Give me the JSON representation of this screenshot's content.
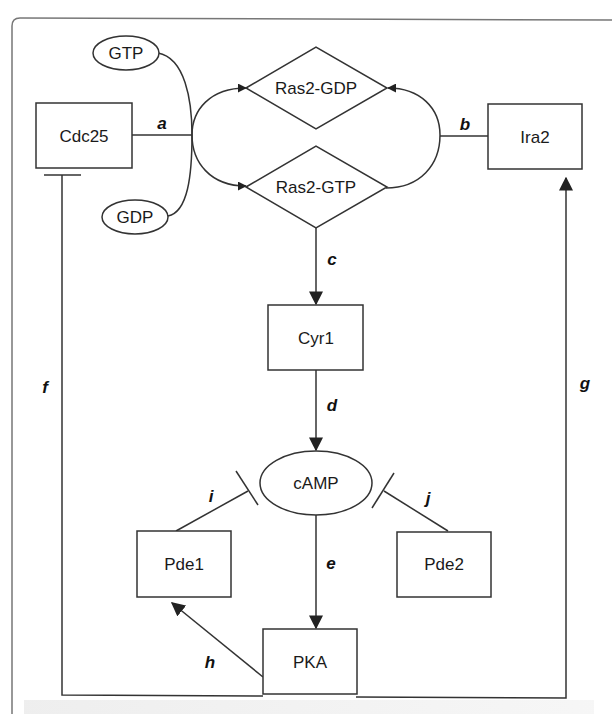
{
  "diagram": {
    "nodes": {
      "gtp": {
        "label": "GTP",
        "shape": "ellipse"
      },
      "gdp": {
        "label": "GDP",
        "shape": "ellipse"
      },
      "cdc25": {
        "label": "Cdc25",
        "shape": "rect"
      },
      "ras2_gdp": {
        "label": "Ras2-GDP",
        "shape": "diamond"
      },
      "ras2_gtp": {
        "label": "Ras2-GTP",
        "shape": "diamond"
      },
      "ira2": {
        "label": "Ira2",
        "shape": "rect"
      },
      "cyr1": {
        "label": "Cyr1",
        "shape": "rect"
      },
      "camp": {
        "label": "cAMP",
        "shape": "ellipse"
      },
      "pde1": {
        "label": "Pde1",
        "shape": "rect"
      },
      "pde2": {
        "label": "Pde2",
        "shape": "rect"
      },
      "pka": {
        "label": "PKA",
        "shape": "rect"
      }
    },
    "edges": {
      "a": {
        "label": "a",
        "from": "Cdc25",
        "to": "Ras2-GDP -> Ras2-GTP",
        "type": "catalysis"
      },
      "b": {
        "label": "b",
        "from": "Ira2",
        "to": "Ras2-GTP -> Ras2-GDP",
        "type": "catalysis"
      },
      "c": {
        "label": "c",
        "from": "Ras2-GTP",
        "to": "Cyr1",
        "type": "activation"
      },
      "d": {
        "label": "d",
        "from": "Cyr1",
        "to": "cAMP",
        "type": "activation"
      },
      "e": {
        "label": "e",
        "from": "cAMP",
        "to": "PKA",
        "type": "activation"
      },
      "f": {
        "label": "f",
        "from": "PKA",
        "to": "Cdc25",
        "type": "inhibition"
      },
      "g": {
        "label": "g",
        "from": "PKA",
        "to": "Ira2",
        "type": "activation"
      },
      "h": {
        "label": "h",
        "from": "PKA",
        "to": "Pde1",
        "type": "activation"
      },
      "i": {
        "label": "i",
        "from": "Pde1",
        "to": "cAMP",
        "type": "inhibition"
      },
      "j": {
        "label": "j",
        "from": "Pde2",
        "to": "cAMP",
        "type": "inhibition"
      }
    }
  }
}
